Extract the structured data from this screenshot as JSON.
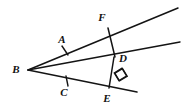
{
  "figure": {
    "type": "geometry-diagram",
    "background_color": "#ffffff",
    "stroke_color": "#141414",
    "canvas": {
      "width": 192,
      "height": 108
    },
    "points": [
      {
        "id": "B",
        "label": "B",
        "x": 28,
        "y": 70,
        "label_x": 16,
        "label_y": 70
      },
      {
        "id": "A",
        "label": "A",
        "x": 66,
        "y": 49,
        "label_x": 62,
        "label_y": 40
      },
      {
        "id": "F",
        "label": "F",
        "x": 108,
        "y": 26,
        "label_x": 102,
        "label_y": 18
      },
      {
        "id": "D",
        "label": "D",
        "x": 114,
        "y": 57,
        "label_x": 123,
        "label_y": 59
      },
      {
        "id": "C",
        "label": "C",
        "x": 66,
        "y": 83,
        "label_x": 64,
        "label_y": 93
      },
      {
        "id": "E",
        "label": "E",
        "x": 108,
        "y": 87,
        "label_x": 107,
        "label_y": 99
      }
    ],
    "rays": [
      {
        "id": "ray-BF",
        "name": "upper-ray-through-A-and-F",
        "x1": 28,
        "y1": 70,
        "x2": 178,
        "y2": 8
      },
      {
        "id": "ray-BD",
        "name": "middle-ray-through-D",
        "x1": 28,
        "y1": 70,
        "x2": 180,
        "y2": 42
      },
      {
        "id": "ray-BE",
        "name": "lower-ray-through-C-and-E",
        "x1": 28,
        "y1": 70,
        "x2": 137,
        "y2": 92
      }
    ],
    "segments": [
      {
        "id": "seg-FD",
        "name": "perpendicular-F-to-D",
        "x1": 108,
        "y1": 28,
        "x2": 115,
        "y2": 57
      },
      {
        "id": "seg-DE",
        "name": "perpendicular-D-to-E",
        "x1": 114,
        "y1": 57,
        "x2": 109,
        "y2": 88
      }
    ],
    "tick_marks": [
      {
        "id": "tick-A",
        "name": "congruence-tick-on-segment-BA",
        "x1": 62,
        "y1": 46,
        "x2": 68,
        "y2": 55
      },
      {
        "id": "tick-C",
        "name": "congruence-tick-on-segment-BC",
        "x1": 66,
        "y1": 76,
        "x2": 68,
        "y2": 86
      }
    ],
    "right_angles": [
      {
        "id": "right-angle-F",
        "name": "right-angle-marker-at-F",
        "cx": 103,
        "cy": 34,
        "size": 9,
        "rotation": -22
      },
      {
        "id": "right-angle-E",
        "name": "right-angle-marker-at-E",
        "cx": 104,
        "cy": 78,
        "size": 9,
        "rotation": -9
      }
    ]
  }
}
